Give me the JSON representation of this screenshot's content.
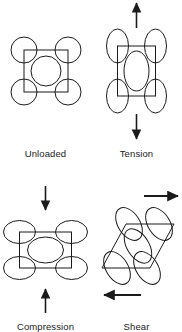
{
  "figure": {
    "stroke_color": "#1b1b1b",
    "fill_color": "none",
    "background_color": "#ffffff",
    "stroke_width": 1,
    "arrow_color": "#1b1b1b"
  },
  "panels": [
    {
      "id": "unloaded",
      "label": "Unloaded",
      "loading_state": "none",
      "arrows": [],
      "cell": {
        "shape": "square",
        "center_x": 46,
        "center_y": 71,
        "half_width": 22,
        "half_height": 21,
        "skew": 0
      },
      "ellipses": {
        "corner_rx": 13,
        "corner_ry": 13,
        "center_rx": 15,
        "center_ry": 15,
        "rotation_deg": 0,
        "offset_x": 22,
        "offset_y": 21,
        "count": 5
      }
    },
    {
      "id": "tension",
      "label": "Tension",
      "loading_state": "tension",
      "arrows": [
        {
          "direction": "up",
          "x": 136.5,
          "y_start": 28,
          "y_end": 2
        },
        {
          "direction": "down",
          "x": 136.5,
          "y_start": 114,
          "y_end": 140
        }
      ],
      "cell": {
        "shape": "rectangle",
        "center_x": 136.5,
        "center_y": 71,
        "half_width": 19,
        "half_height": 25,
        "skew": 0
      },
      "ellipses": {
        "corner_rx": 11,
        "corner_ry": 17,
        "center_rx": 12.5,
        "center_ry": 20,
        "rotation_deg": 0,
        "offset_x": 19,
        "offset_y": 25,
        "count": 5
      }
    },
    {
      "id": "compression",
      "label": "Compression",
      "loading_state": "compression",
      "arrows": [
        {
          "direction": "down",
          "x": 45.5,
          "y_start": 186,
          "y_end": 211
        },
        {
          "direction": "up",
          "x": 45.5,
          "y_start": 313,
          "y_end": 288
        }
      ],
      "cell": {
        "shape": "rectangle",
        "center_x": 45.5,
        "center_y": 250,
        "half_width": 26,
        "half_height": 18,
        "skew": 0
      },
      "ellipses": {
        "corner_rx": 16,
        "corner_ry": 11.5,
        "center_rx": 18,
        "center_ry": 13,
        "rotation_deg": 0,
        "offset_x": 26,
        "offset_y": 18,
        "count": 5
      }
    },
    {
      "id": "shear",
      "label": "Shear",
      "loading_state": "shear",
      "arrows": [
        {
          "direction": "right",
          "y": 196,
          "x_start": 144,
          "x_end": 179
        },
        {
          "direction": "left",
          "y": 295,
          "x_start": 141,
          "x_end": 103
        }
      ],
      "cell": {
        "shape": "parallelogram",
        "center_x": 138,
        "center_y": 246,
        "half_width": 24,
        "half_height": 22,
        "skew": 12
      },
      "ellipses": {
        "corner_rx": 11,
        "corner_ry": 18,
        "center_rx": 11,
        "center_ry": 19,
        "rotation_deg": -32,
        "offset_x": 21,
        "offset_y": 22,
        "count": 5
      }
    }
  ]
}
